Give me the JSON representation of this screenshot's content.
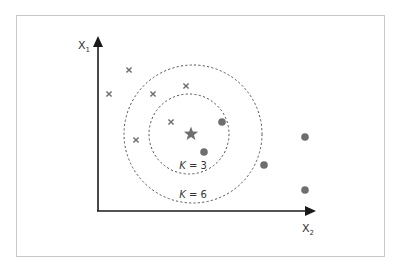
{
  "axes": {
    "y_label": "X",
    "y_sub": "1",
    "x_label": "X",
    "x_sub": "2",
    "origin": [
      98,
      211
    ],
    "x_end": [
      316,
      211
    ],
    "y_end": [
      98,
      36
    ]
  },
  "query_point": {
    "shape": "star",
    "x": 191,
    "y": 134,
    "color": "#6e6e6e"
  },
  "class_a_points": {
    "marker": "cross",
    "color": "#6e6e6e",
    "points": [
      [
        109,
        94
      ],
      [
        129,
        70
      ],
      [
        153,
        94
      ],
      [
        186,
        86
      ],
      [
        171,
        122
      ],
      [
        136,
        140
      ]
    ]
  },
  "class_b_points": {
    "marker": "dot",
    "color": "#6e6e6e",
    "points": [
      [
        222,
        122
      ],
      [
        204,
        152
      ],
      [
        264,
        165
      ],
      [
        305,
        137
      ],
      [
        305,
        190
      ]
    ]
  },
  "circles": [
    {
      "label": "K = 3",
      "cx": 189,
      "cy": 134,
      "r": 40,
      "label_x": 193,
      "label_y": 169
    },
    {
      "label": "K = 6",
      "cx": 193,
      "cy": 134,
      "r": 69,
      "label_x": 193,
      "label_y": 198
    }
  ],
  "colors": {
    "axis": "#1a1a1a",
    "marker": "#6e6e6e",
    "circle": "#555555",
    "border": "#c8c8c8"
  }
}
